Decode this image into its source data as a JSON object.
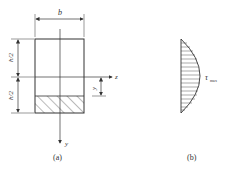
{
  "figure_a": {
    "caption": "(a)",
    "width_label": "b",
    "top_half_label": "h/2",
    "bottom_half_label": "h/2",
    "z_axis_label": "z",
    "y_axis_label": "y",
    "y_dim_label": "y"
  },
  "figure_b": {
    "caption": "(b)",
    "tau_symbol": "τ",
    "tau_subscript": "max"
  },
  "colors": {
    "line": "#333333",
    "hatch": "#555555"
  }
}
